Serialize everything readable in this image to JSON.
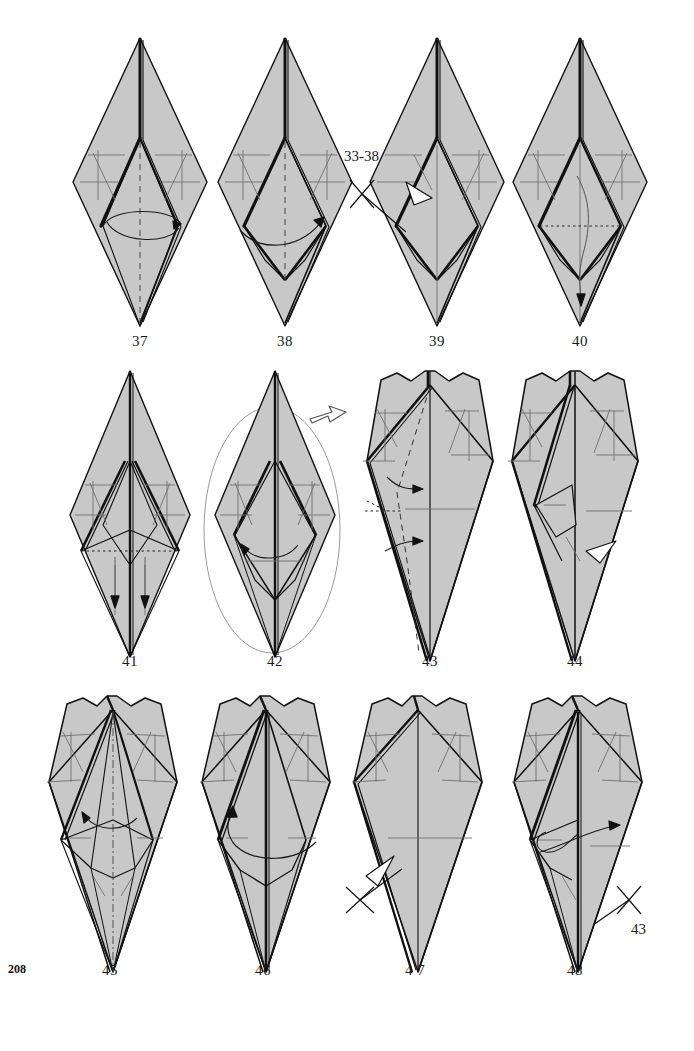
{
  "page": {
    "page_number": "208",
    "paper_fill": "#c8c8c8",
    "line_color": "#111111",
    "crease_color": "#6b6b6b",
    "background": "#ffffff",
    "width": 694,
    "height": 1051
  },
  "rows": [
    {
      "id": "row-1",
      "figures": [
        {
          "label": "37",
          "name": "figure-37",
          "shape": "tall-kite-diamond",
          "notes": "valley fold, vertical dashed center line, curved rotate arrow across lower body"
        },
        {
          "label": "38",
          "name": "figure-38",
          "shape": "tall-kite-diamond-with-lower-pocket",
          "notes": "vertical dashed center line, curved arrow sweeping right"
        },
        {
          "label": "39",
          "name": "figure-39",
          "shape": "tall-kite-diamond-with-lower-pocket",
          "notes": "hollow push-in arrow at left, repeat-steps annotation"
        },
        {
          "label": "40",
          "name": "figure-40",
          "shape": "tall-kite-diamond-with-lower-pocket",
          "notes": "horizontal dotted hidden-edge line, long curved arrow pointing down"
        }
      ]
    },
    {
      "id": "row-2",
      "figures": [
        {
          "label": "41",
          "name": "figure-41",
          "shape": "narrow-spike-diamond",
          "notes": "dotted hidden edge across the middle, two short arrows pointing down"
        },
        {
          "label": "42",
          "name": "figure-42",
          "shape": "narrow-spike-diamond",
          "notes": "enclosed in a magnify ellipse, hollow turn-over arrow at upper right, curved arrow to the left"
        },
        {
          "label": "43",
          "name": "figure-43",
          "shape": "notched-top-long-diamond",
          "notes": "dashed fold line down the left, two arrows pointing right"
        },
        {
          "label": "44",
          "name": "figure-44",
          "shape": "notched-top-long-diamond-layered",
          "notes": "hollow push arrow at lower right with repeat annotation"
        }
      ]
    },
    {
      "id": "row-3",
      "figures": [
        {
          "label": "45",
          "name": "figure-45",
          "shape": "notched-top-long-diamond-layered",
          "notes": "dash-dot center line, curved arrow pointing left"
        },
        {
          "label": "46",
          "name": "figure-46",
          "shape": "notched-top-long-diamond-layered",
          "notes": "long curved arrow sweeping from right to upper left"
        },
        {
          "label": "4 7",
          "name": "figure-47",
          "shape": "notched-top-plain-diamond",
          "notes": "hollow push arrow at lower left with repeat annotation"
        },
        {
          "label": "48",
          "name": "figure-48",
          "shape": "notched-top-long-diamond-layered",
          "notes": "looping curved arrow pointing right"
        }
      ]
    }
  ],
  "annotations": [
    {
      "id": "annot-3338",
      "name": "repeat-steps-33-38-label",
      "text": "33-38",
      "symbol": "repeat-cross-arrow"
    },
    {
      "id": "annot-43-fig44",
      "name": "repeat-step-43-label-figure-44",
      "text": "43",
      "symbol": "repeat-cross-arrow"
    },
    {
      "id": "annot-43-fig47",
      "name": "repeat-step-43-label-figure-47",
      "text": "43",
      "symbol": "repeat-cross-arrow"
    }
  ]
}
